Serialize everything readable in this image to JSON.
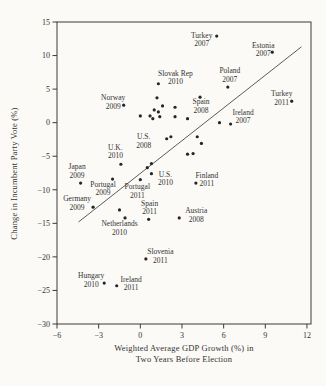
{
  "figure": {
    "y_axis_label": "Change in Incumbent Party Vote (%)",
    "x_axis_label_line1": "Weighted Average GDP Growth (%) in",
    "x_axis_label_line2": "Two Years Before Election"
  },
  "chart_data": {
    "type": "scatter",
    "title": "",
    "xlabel": "Weighted Average GDP Growth (%) in Two Years Before Election",
    "ylabel": "Change in Incumbent Party Vote (%)",
    "xlim": [
      -6,
      12.3
    ],
    "ylim": [
      -30,
      15
    ],
    "x_ticks": [
      -6,
      -3,
      0,
      3,
      6,
      9,
      12
    ],
    "y_ticks": [
      15,
      10,
      5,
      0,
      -5,
      -10,
      -15,
      -20,
      -25,
      -30
    ],
    "grid": false,
    "legend": "none",
    "point_color": "#262626",
    "axis_color": "#3b3b3b",
    "regression_line": {
      "x1": -4.45,
      "y1": -14.8,
      "x2": 11.6,
      "y2": 11.3
    },
    "labeled_points": [
      {
        "country": "Turkey",
        "year": "2007",
        "x": 5.5,
        "y": 12.9,
        "lx": -15,
        "ly": 3.5
      },
      {
        "country": "Estonia",
        "year": "2007",
        "x": 9.5,
        "y": 10.5,
        "lx": -9,
        "ly": -3
      },
      {
        "country": "Poland",
        "year": "2007",
        "x": 6.3,
        "y": 5.3,
        "lx": 2,
        "ly": -12
      },
      {
        "country": "Turkey",
        "year": "2011",
        "x": 10.9,
        "y": 3.2,
        "lx": -10,
        "ly": -3.5
      },
      {
        "country": "Slovak Rep",
        "year": "2010",
        "x": 1.3,
        "y": 5.8,
        "lx": 17,
        "ly": -6.5
      },
      {
        "country": "Norway",
        "year": "2009",
        "x": -1.2,
        "y": 2.6,
        "lx": -10.5,
        "ly": -3.5
      },
      {
        "country": "Spain",
        "year": "2008",
        "x": 4.3,
        "y": 3.8,
        "lx": 1,
        "ly": 8.5
      },
      {
        "country": "Ireland",
        "year": "2007",
        "x": 6.5,
        "y": -0.2,
        "lx": 12.5,
        "ly": -7.5
      },
      {
        "country": "U.K.",
        "year": "2010",
        "x": -1.4,
        "y": -6.2,
        "lx": -5.5,
        "ly": -13
      },
      {
        "country": "U.S.",
        "year": "2008",
        "x": 1.9,
        "y": -2.4,
        "lx": -23,
        "ly": 2
      },
      {
        "country": "U.S.",
        "year": "2010",
        "x": 0.8,
        "y": -7.6,
        "lx": 14,
        "ly": 4.5
      },
      {
        "country": "Japan",
        "year": "2009",
        "x": -4.3,
        "y": -9.0,
        "lx": -3.5,
        "ly": -12
      },
      {
        "country": "Portugal",
        "year": "2009",
        "x": -2.0,
        "y": -8.4,
        "lx": -9.5,
        "ly": 9.5
      },
      {
        "country": "Portugal",
        "year": "2011",
        "x": 0.0,
        "y": -8.5,
        "lx": -3,
        "ly": 11
      },
      {
        "country": "Finland",
        "year": "2011",
        "x": 4.0,
        "y": -9.0,
        "lx": 11,
        "ly": -3.5
      },
      {
        "country": "Germany",
        "year": "2009",
        "x": -3.4,
        "y": -12.6,
        "lx": -16,
        "ly": -4.5
      },
      {
        "country": "Spain",
        "year": "2011",
        "x": 0.6,
        "y": -14.4,
        "lx": 1,
        "ly": -12
      },
      {
        "country": "Netherlands",
        "year": "2010",
        "x": -1.1,
        "y": -14.2,
        "lx": -5.5,
        "ly": 10
      },
      {
        "country": "Austria",
        "year": "2008",
        "x": 2.8,
        "y": -14.2,
        "lx": 17,
        "ly": -3
      },
      {
        "country": "Slovenia",
        "year": "2011",
        "x": 0.4,
        "y": -20.3,
        "lx": 14.5,
        "ly": -3
      },
      {
        "country": "Hungary",
        "year": "2010",
        "x": -2.6,
        "y": -23.9,
        "lx": -13,
        "ly": -3
      },
      {
        "country": "Ireland",
        "year": "2011",
        "x": -1.7,
        "y": -24.3,
        "lx": 14.5,
        "ly": -2.5
      }
    ],
    "unlabeled_points": [
      {
        "x": 1.2,
        "y": 3.7
      },
      {
        "x": 1.6,
        "y": 2.5
      },
      {
        "x": 2.5,
        "y": 2.3
      },
      {
        "x": 1.0,
        "y": 1.9
      },
      {
        "x": 1.3,
        "y": 1.6
      },
      {
        "x": 0.7,
        "y": 1.0
      },
      {
        "x": 0.9,
        "y": 0.6
      },
      {
        "x": 1.4,
        "y": 0.9
      },
      {
        "x": 2.5,
        "y": 0.9
      },
      {
        "x": 3.4,
        "y": 0.6
      },
      {
        "x": 0.0,
        "y": 1.0
      },
      {
        "x": 5.7,
        "y": 0.0
      },
      {
        "x": 2.2,
        "y": -2.1
      },
      {
        "x": 4.1,
        "y": -2.1
      },
      {
        "x": 4.4,
        "y": -3.1
      },
      {
        "x": 3.4,
        "y": -4.7
      },
      {
        "x": 3.8,
        "y": -4.6
      },
      {
        "x": 0.8,
        "y": -6.1
      },
      {
        "x": 0.5,
        "y": -6.7
      },
      {
        "x": -1.5,
        "y": -13.0
      }
    ]
  }
}
